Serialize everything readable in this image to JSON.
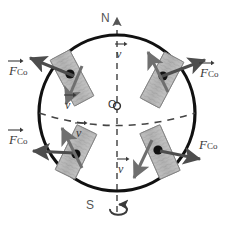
{
  "diagram": {
    "colors": {
      "outline": "#111111",
      "dashed_axis": "#555555",
      "arrow_force": "#4d4d4d",
      "arrow_velocity": "#6b6b6b",
      "air_mass_fill": "#b5b5b5",
      "air_mass_edge": "#8a8a8a",
      "dot": "#111111",
      "label_text": "#3a3a3a",
      "background": "#ffffff"
    },
    "poles": {
      "north_label": "N",
      "south_label": "S"
    },
    "center_label": "O",
    "axis": {
      "name": "rotation-axis",
      "style": "dashed",
      "top_arrow": true,
      "spin_arrow": true
    },
    "equator": {
      "name": "equator",
      "style": "dashed"
    },
    "force_labels": [
      {
        "id": "force-label-top-left",
        "symbol": "F",
        "subscript": "Co",
        "vector_arrow": true,
        "quadrant": "northern-hemisphere-west"
      },
      {
        "id": "force-label-top-right",
        "symbol": "F",
        "subscript": "Co",
        "vector_arrow": true,
        "quadrant": "northern-hemisphere-east"
      },
      {
        "id": "force-label-bottom-left",
        "symbol": "F",
        "subscript": "Co",
        "vector_arrow": true,
        "quadrant": "southern-hemisphere-west"
      },
      {
        "id": "force-label-bottom-right",
        "symbol": "F",
        "subscript": "Co",
        "vector_arrow": false,
        "quadrant": "southern-hemisphere-east"
      }
    ],
    "velocity_labels": [
      {
        "id": "velocity-label-top-right",
        "symbol": "v",
        "vector_arrow": true,
        "quadrant": "northern-hemisphere-east"
      },
      {
        "id": "velocity-label-top-left",
        "symbol": "v",
        "vector_arrow": true,
        "quadrant": "northern-hemisphere-west"
      },
      {
        "id": "velocity-label-bottom-left",
        "symbol": "v",
        "vector_arrow": true,
        "quadrant": "southern-hemisphere-west"
      },
      {
        "id": "velocity-label-bottom-right",
        "symbol": "v",
        "vector_arrow": true,
        "quadrant": "southern-hemisphere-east"
      }
    ],
    "air_masses": [
      {
        "id": "air-mass-top-left",
        "tilt_deg": -28,
        "dot": true
      },
      {
        "id": "air-mass-top-right",
        "tilt_deg": 28,
        "dot": true
      },
      {
        "id": "air-mass-bottom-left",
        "tilt_deg": 28,
        "dot": true
      },
      {
        "id": "air-mass-bottom-right",
        "tilt_deg": -24,
        "dot": true
      }
    ]
  }
}
